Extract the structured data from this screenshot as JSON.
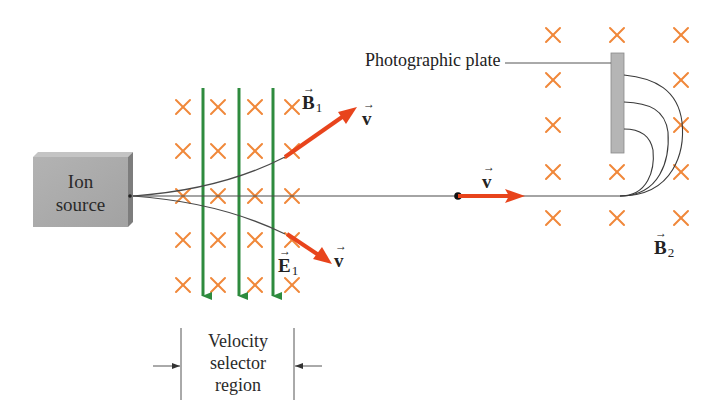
{
  "diagram": {
    "labels": {
      "ion_source_line1": "Ion",
      "ion_source_line2": "source",
      "photographic_plate": "Photographic plate",
      "velocity_selector_line1": "Velocity",
      "velocity_selector_line2": "selector",
      "velocity_selector_line3": "region",
      "b1": "B",
      "b1_sub": "1",
      "e1": "E",
      "e1_sub": "1",
      "b2": "B",
      "b2_sub": "2",
      "v_upper": "v",
      "v_lower": "v",
      "v_middle": "v",
      "vector_arrow": "→"
    },
    "colors": {
      "field_cross": "#f0883a",
      "electric_field": "#2e8b3e",
      "velocity_arrow": "#e8441c",
      "ion_source": "#a9a9a9",
      "plate": "#b5b5b5",
      "beam": "#444444"
    },
    "elements": {
      "selector_crosses_columns": 4,
      "selector_crosses_rows": 5,
      "electric_field_arrows": 3,
      "b2_crosses_columns": 3,
      "b2_crosses_rows": 5,
      "ion_trajectories_to_plate": 3
    }
  }
}
